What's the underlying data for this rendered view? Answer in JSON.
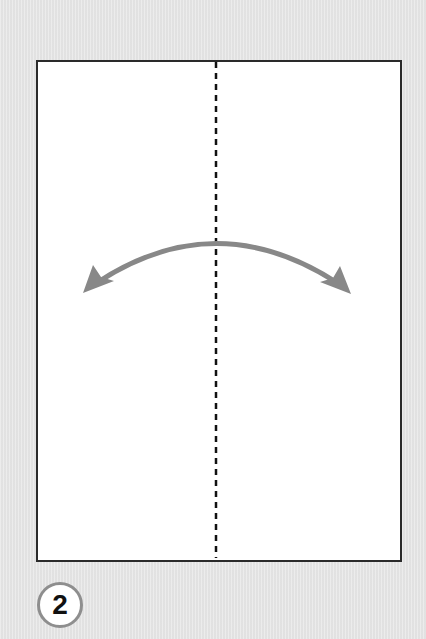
{
  "diagram": {
    "step_number": "2",
    "paper": {
      "fill": "#ffffff",
      "border": "#2a2a2a"
    },
    "fold_line": {
      "style": "dashed",
      "color": "#111111",
      "type": "valley-fold-crease"
    },
    "arrow": {
      "type": "fold-and-unfold",
      "color": "#888888"
    },
    "badge": {
      "ring_color": "#8e8e8e",
      "fill": "#ffffff"
    },
    "background": "#e6e6e6"
  }
}
